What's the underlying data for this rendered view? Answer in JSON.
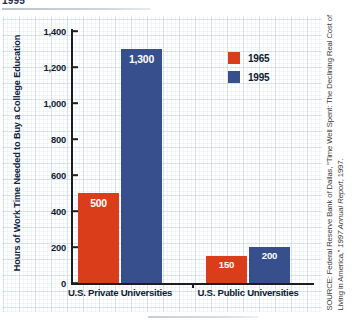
{
  "top_remnant": "1995",
  "chart_data": {
    "type": "bar",
    "title": "",
    "xlabel": "",
    "ylabel": "Hours of Work Time Needed to Buy a College Education",
    "ylim": [
      0,
      1400
    ],
    "grid": true,
    "legend_position": "top-right",
    "categories": [
      "U.S. Private Universities",
      "U.S. Public Universities"
    ],
    "series": [
      {
        "name": "1965",
        "color": "#d93d1a",
        "values": [
          500,
          150
        ],
        "labels": [
          "500",
          "150"
        ]
      },
      {
        "name": "1995",
        "color": "#374f8c",
        "values": [
          1300,
          200
        ],
        "labels": [
          "1,300",
          "200"
        ]
      }
    ],
    "y_ticks": [
      0,
      200,
      400,
      600,
      800,
      1000,
      1200,
      1400
    ],
    "y_tick_labels": [
      "0",
      "200",
      "400",
      "600",
      "800",
      "1,000",
      "1,200",
      "1,400"
    ]
  },
  "legend": {
    "items": [
      {
        "label": "1965",
        "color": "#d93d1a"
      },
      {
        "label": "1995",
        "color": "#374f8c"
      }
    ]
  },
  "source": {
    "prefix": "SOURCE: Federal Reserve Bank of Dallas, “Time Well Spent: The Declining Real Cost of Living in America,” ",
    "italic": "1997 Annual Report",
    "suffix": ", 1997."
  },
  "colors": {
    "red": "#d93d1a",
    "blue": "#374f8c",
    "axis": "#1d1d20",
    "grid": "#96bec8",
    "text": "#0f1b33"
  }
}
